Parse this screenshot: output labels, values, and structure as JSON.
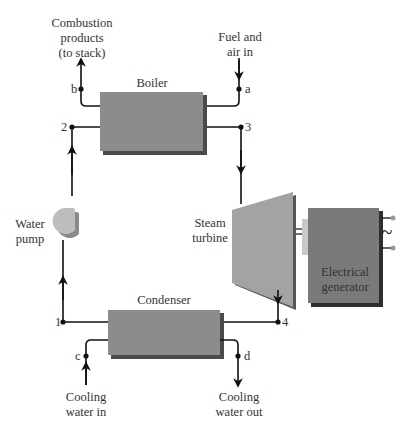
{
  "components": {
    "boiler": {
      "label": "Boiler"
    },
    "turbine": {
      "label_line1": "Steam",
      "label_line2": "turbine"
    },
    "generator": {
      "label_line1": "Electrical",
      "label_line2": "generator",
      "ac_symbol": "~"
    },
    "condenser": {
      "label": "Condenser"
    },
    "pump": {
      "label_line1": "Water",
      "label_line2": "pump"
    }
  },
  "streams": {
    "combustion": {
      "line1": "Combustion",
      "line2": "products",
      "line3": "(to stack)"
    },
    "fuel": {
      "line1": "Fuel and",
      "line2": "air in"
    },
    "cooling_in": {
      "line1": "Cooling",
      "line2": "water in"
    },
    "cooling_out": {
      "line1": "Cooling",
      "line2": "water out"
    }
  },
  "state_points": {
    "p1": "1",
    "p2": "2",
    "p3": "3",
    "p4": "4",
    "a": "a",
    "b": "b",
    "c": "c",
    "d": "d"
  },
  "colors": {
    "box_fill": "#8c8c8c",
    "box_shadow": "#4a4a4a",
    "turbine_fill": "#a3a3a3",
    "generator_fill": "#7a7a7a",
    "pump_fill": "#bdbdbd",
    "line": "#111111"
  }
}
